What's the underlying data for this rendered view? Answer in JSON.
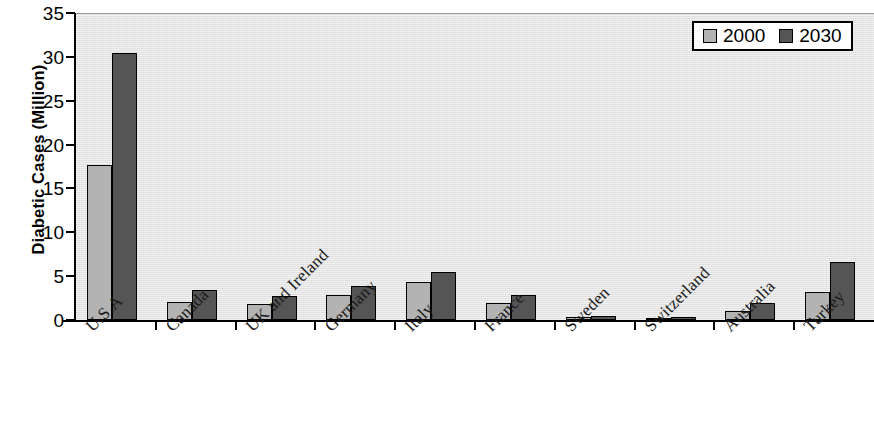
{
  "chart_data": {
    "type": "bar",
    "title": "",
    "xlabel": "",
    "ylabel": "Diabetic Cases (Million)",
    "ylim": [
      0,
      35
    ],
    "ytick_step": 5,
    "yticks": [
      35,
      30,
      25,
      20,
      15,
      10,
      5,
      0
    ],
    "ytick_labels": [
      "35",
      "30",
      "25",
      "20",
      "15",
      "10",
      "5",
      "0"
    ],
    "grid": false,
    "legend_position": "top-right",
    "categories": [
      "U.S.A",
      "Canada",
      "UK and Ireland",
      "Germany",
      "Italy",
      "France",
      "Sweden",
      "Switzerland",
      "Australia",
      "Turkey"
    ],
    "series": [
      {
        "name": "2000",
        "color": "#b3b3b3",
        "values": [
          17.7,
          2.1,
          1.8,
          2.8,
          4.3,
          1.9,
          0.3,
          0.2,
          1.0,
          3.2
        ]
      },
      {
        "name": "2030",
        "color": "#555555",
        "values": [
          30.4,
          3.4,
          2.7,
          3.9,
          5.5,
          2.8,
          0.5,
          0.3,
          1.9,
          6.6
        ]
      }
    ],
    "plot_background": "#e9e9e9",
    "axis_color": "#000000"
  },
  "legend": {
    "entries": [
      {
        "label": "2000",
        "swatch": "light-gray-swatch"
      },
      {
        "label": "2030",
        "swatch": "dark-gray-swatch"
      }
    ]
  }
}
